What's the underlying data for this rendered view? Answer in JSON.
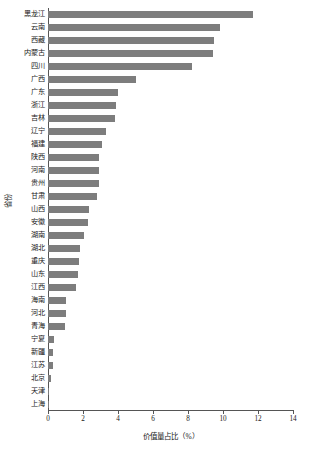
{
  "chart_data": {
    "type": "bar",
    "orientation": "horizontal",
    "title": "",
    "xlabel": "价值量占比（%）",
    "ylabel": "省份",
    "xlim": [
      0,
      14
    ],
    "xticks": [
      0,
      2,
      4,
      6,
      8,
      10,
      12,
      14
    ],
    "xtick_labels": [
      "0",
      "2",
      "4",
      "6",
      "8",
      "10",
      "12",
      "14"
    ],
    "grid": false,
    "legend": null,
    "bar_color": "#7d7d7d",
    "axis_color": "#555555",
    "categories": [
      "黑龙江",
      "云南",
      "西藏",
      "内蒙古",
      "四川",
      "广西",
      "广东",
      "浙江",
      "吉林",
      "辽宁",
      "福建",
      "陕西",
      "河南",
      "贵州",
      "甘肃",
      "山西",
      "安徽",
      "湖南",
      "湖北",
      "重庆",
      "山东",
      "江西",
      "海南",
      "河北",
      "青海",
      "宁夏",
      "新疆",
      "江苏",
      "北京",
      "天津",
      "上海"
    ],
    "values": [
      11.7,
      9.8,
      9.5,
      9.4,
      8.2,
      5.0,
      4.0,
      3.9,
      3.8,
      3.3,
      3.1,
      2.9,
      2.9,
      2.9,
      2.8,
      2.35,
      2.3,
      2.05,
      1.8,
      1.75,
      1.7,
      1.6,
      1.05,
      1.0,
      0.95,
      0.35,
      0.3,
      0.3,
      0.15,
      0.03,
      0.03
    ]
  }
}
